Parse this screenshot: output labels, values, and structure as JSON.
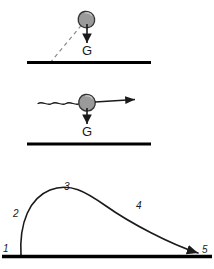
{
  "figure": {
    "colors": {
      "ink": "#1a1a1a",
      "ground": "#000000",
      "rock_fill": "#9a9a9a",
      "rock_stroke": "#333333",
      "dashed": "#777777",
      "background": "#ffffff"
    }
  },
  "panels": [
    {
      "id": "panel-launch",
      "name": "rock-in-flight-with-gravity",
      "gravity_label": "G",
      "ground_label": "",
      "elements": {
        "rock": "rock-blob",
        "dashed_path": "launch-trajectory-dashed",
        "gravity_arrow": "gravity-vector-arrow",
        "ground": "ground-line"
      }
    },
    {
      "id": "panel-horizontal",
      "name": "rock-horizontal-motion-with-gravity",
      "gravity_label": "G",
      "elements": {
        "rock": "rock-blob",
        "wavy_path": "incoming-wavy-path",
        "velocity_arrow": "velocity-vector-arrow",
        "gravity_arrow": "gravity-vector-arrow",
        "ground": "ground-line"
      }
    },
    {
      "id": "panel-trajectory",
      "name": "ballistic-trajectory-arc",
      "elements": {
        "arc": "trajectory-arc",
        "ground": "ground-line"
      }
    }
  ],
  "trajectory_labels": [
    {
      "id": "1",
      "text": "1",
      "x": 3,
      "y": 252
    },
    {
      "id": "2",
      "text": "2",
      "x": 13,
      "y": 217
    },
    {
      "id": "3",
      "text": "3",
      "x": 64,
      "y": 190
    },
    {
      "id": "4",
      "text": "4",
      "x": 136,
      "y": 209
    },
    {
      "id": "5",
      "text": "5",
      "x": 202,
      "y": 253
    }
  ],
  "gravity_labels": [
    {
      "id": "g-top",
      "text": "G",
      "x": 82,
      "y": 55
    },
    {
      "id": "g-mid",
      "text": "G",
      "x": 82,
      "y": 136
    }
  ]
}
